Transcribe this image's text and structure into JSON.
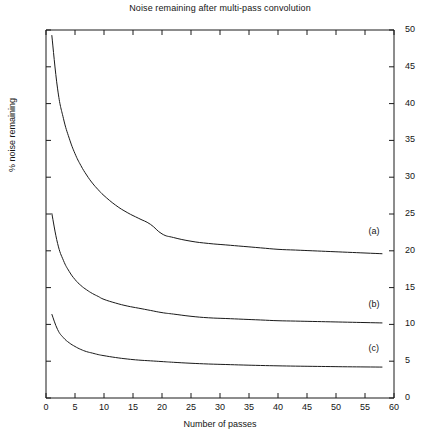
{
  "chart_data": {
    "type": "line",
    "title": "Noise remaining after multi-pass convolution",
    "xlabel": "Number of passes",
    "ylabel": "% noise remaining",
    "xlim": [
      0,
      60
    ],
    "ylim": [
      0,
      50
    ],
    "grid": false,
    "legend_position": "inline-right",
    "xticks": [
      0,
      5,
      10,
      15,
      20,
      25,
      30,
      35,
      40,
      45,
      50,
      55,
      60
    ],
    "xtick_labels": [
      "0",
      "5",
      "10",
      "15",
      "20",
      "25",
      "30",
      "35",
      "40",
      "45",
      "50",
      "55",
      "60"
    ],
    "yticks": [
      0,
      5,
      10,
      15,
      20,
      25,
      30,
      35,
      40,
      45,
      50
    ],
    "ytick_labels": [
      "0",
      "5",
      "10",
      "15",
      "20",
      "25",
      "30",
      "35",
      "40",
      "45",
      "50"
    ],
    "y_axis_side": "right",
    "line_color": "#1a1a1a",
    "x": [
      1,
      2,
      3,
      4,
      5,
      6,
      7,
      8,
      9,
      10,
      12,
      14,
      16,
      18,
      20,
      22,
      25,
      28,
      31,
      34,
      37,
      40,
      43,
      46,
      49,
      52,
      55,
      58
    ],
    "series": [
      {
        "name": "(a)",
        "label": "(a)",
        "label_x": 57,
        "label_y": 22.6,
        "values": [
          49.3,
          42.0,
          38.0,
          35.3,
          33.2,
          31.6,
          30.3,
          29.2,
          28.3,
          27.5,
          26.2,
          25.2,
          24.4,
          23.6,
          22.3,
          21.8,
          21.3,
          21.0,
          20.8,
          20.6,
          20.4,
          20.2,
          20.1,
          20.0,
          19.9,
          19.8,
          19.7,
          19.6
        ]
      },
      {
        "name": "(b)",
        "label": "(b)",
        "label_x": 57,
        "label_y": 12.7,
        "values": [
          25.1,
          21.0,
          18.7,
          17.2,
          16.1,
          15.3,
          14.7,
          14.2,
          13.8,
          13.4,
          12.9,
          12.5,
          12.2,
          11.9,
          11.6,
          11.4,
          11.1,
          10.9,
          10.8,
          10.7,
          10.6,
          10.5,
          10.45,
          10.4,
          10.35,
          10.3,
          10.25,
          10.2
        ]
      },
      {
        "name": "(c)",
        "label": "(c)",
        "label_x": 57,
        "label_y": 6.6,
        "values": [
          11.4,
          9.3,
          8.2,
          7.5,
          7.0,
          6.6,
          6.3,
          6.1,
          5.9,
          5.75,
          5.5,
          5.3,
          5.15,
          5.05,
          4.95,
          4.85,
          4.72,
          4.62,
          4.55,
          4.48,
          4.42,
          4.37,
          4.33,
          4.3,
          4.27,
          4.24,
          4.22,
          4.2
        ]
      }
    ]
  }
}
